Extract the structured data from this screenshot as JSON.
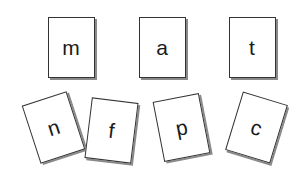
{
  "cards": [
    {
      "letter": "m",
      "row": "top",
      "cx": 71,
      "cy": 47,
      "rotation": 0
    },
    {
      "letter": "a",
      "row": "top",
      "cx": 162,
      "cy": 47,
      "rotation": 0
    },
    {
      "letter": "t",
      "row": "top",
      "cx": 252,
      "cy": 47,
      "rotation": 0
    },
    {
      "letter": "n",
      "row": "bottom",
      "cx": 53,
      "cy": 127,
      "rotation": -18
    },
    {
      "letter": "f",
      "row": "bottom",
      "cx": 111,
      "cy": 130,
      "rotation": 7
    },
    {
      "letter": "p",
      "row": "bottom",
      "cx": 181,
      "cy": 127,
      "rotation": -11
    },
    {
      "letter": "c",
      "row": "bottom",
      "cx": 256,
      "cy": 127,
      "rotation": 17
    }
  ]
}
